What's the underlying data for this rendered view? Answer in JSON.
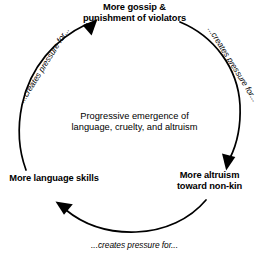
{
  "diagram": {
    "stroke_color": "#000000",
    "background_color": "#ffffff",
    "center_text": {
      "line1": "Progressive emergence of",
      "line2": "language, cruelty, and altruism"
    },
    "nodes": [
      {
        "id": "gossip",
        "position": "top",
        "line1": "More gossip &",
        "line2": "punishment of violators"
      },
      {
        "id": "altruism",
        "position": "right",
        "line1": "More altruism",
        "line2": "toward non-kin"
      },
      {
        "id": "language",
        "position": "left",
        "line1": "More language skills",
        "line2": ""
      }
    ],
    "edges": [
      {
        "id": "gossip-to-altruism",
        "position": "right",
        "label": "...creates pressure for...",
        "from": "gossip",
        "to": "altruism"
      },
      {
        "id": "altruism-to-language",
        "position": "bottom",
        "label": "...creates pressure for...",
        "from": "altruism",
        "to": "language"
      },
      {
        "id": "language-to-gossip",
        "position": "left",
        "label": "...creates pressure for...",
        "from": "language",
        "to": "gossip"
      }
    ]
  }
}
